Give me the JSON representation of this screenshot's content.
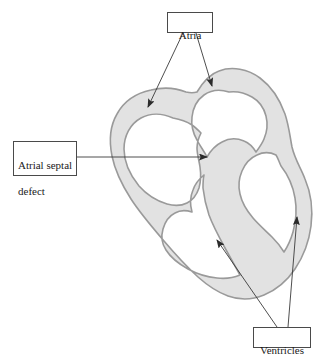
{
  "figure": {
    "background_color": "#ffffff"
  },
  "colors": {
    "wall_fill": "#e2e2e2",
    "wall_stroke": "#9a9a9a",
    "leader_line": "#3a3a3a",
    "box_border": "#4a4a4a",
    "text": "#1a1a1a"
  },
  "labels": {
    "atria": {
      "text": "Atria",
      "box": {
        "x": 167,
        "y": 12,
        "w": 46,
        "h": 21
      }
    },
    "atrial_septal_defect": {
      "line1": "Atrial septal",
      "line2": "defect",
      "text": "Atrial septal\ndefect",
      "box": {
        "x": 13,
        "y": 141,
        "w": 64,
        "h": 35
      }
    },
    "ventricles": {
      "text": "Ventricles",
      "box": {
        "x": 253,
        "y": 327,
        "w": 58,
        "h": 21
      }
    }
  },
  "leaders": [
    {
      "name": "atria-to-left-atrium",
      "from": [
        183,
        33
      ],
      "to": [
        147,
        109
      ],
      "arrowhead": "end"
    },
    {
      "name": "atria-to-right-atrium",
      "from": [
        196,
        33
      ],
      "to": [
        213,
        88
      ],
      "arrowhead": "end"
    },
    {
      "name": "asd-to-septal-defect",
      "from": [
        77,
        157
      ],
      "to": [
        208,
        157
      ],
      "arrowhead": "end"
    },
    {
      "name": "ventricles-to-left-ventricle",
      "from": [
        277,
        327
      ],
      "to": [
        216,
        238
      ],
      "arrowhead": "end"
    },
    {
      "name": "ventricles-to-right-ventricle",
      "from": [
        288,
        327
      ],
      "to": [
        297,
        215
      ],
      "arrowhead": "end"
    }
  ],
  "anatomy": {
    "outer_wall": "heart-silhouette-outer-contour",
    "left_atrium_chamber": "left-atrium-cavity",
    "right_atrium_chamber": "right-atrium-cavity",
    "left_ventricle_chamber": "left-ventricle-cavity",
    "right_ventricle_chamber": "right-ventricle-cavity",
    "septum": "interventricular-and-interatrial-septum",
    "defect_gap": "opening-in-atrial-septum"
  }
}
